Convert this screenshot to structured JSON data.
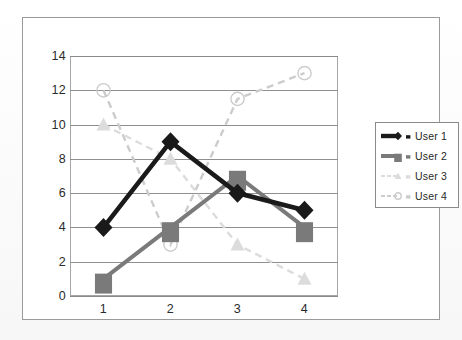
{
  "chart_data": {
    "type": "line",
    "title": "",
    "xlabel": "",
    "ylabel": "",
    "categories": [
      "1",
      "2",
      "3",
      "4"
    ],
    "x": [
      1,
      2,
      3,
      4
    ],
    "ylim": [
      0,
      14
    ],
    "yticks": [
      0,
      2,
      4,
      6,
      8,
      10,
      12,
      14
    ],
    "grid": true,
    "legend_position": "right",
    "series": [
      {
        "name": "User 1",
        "values": [
          4,
          9,
          6,
          5
        ],
        "color": "#1a1a1a",
        "marker": "diamond",
        "linestyle": "solid"
      },
      {
        "name": "User 2",
        "values": [
          1,
          4,
          7,
          4
        ],
        "color": "#7a7a7a",
        "marker": "square",
        "linestyle": "solid"
      },
      {
        "name": "User 3",
        "values": [
          10,
          8,
          3,
          1
        ],
        "color": "#dcdcdc",
        "marker": "triangle",
        "linestyle": "dashed"
      },
      {
        "name": "User 4",
        "values": [
          12,
          3,
          11.5,
          13
        ],
        "color": "#cccccc",
        "marker": "circle",
        "linestyle": "dashed"
      }
    ]
  },
  "axes": {
    "y_tick_labels": [
      "0",
      "2",
      "4",
      "6",
      "8",
      "10",
      "12",
      "14"
    ],
    "x_tick_labels": [
      "1",
      "2",
      "3",
      "4"
    ]
  },
  "legend": {
    "entries": [
      {
        "label": "User 1"
      },
      {
        "label": "User 2"
      },
      {
        "label": "User 3"
      },
      {
        "label": "User 4"
      }
    ]
  }
}
